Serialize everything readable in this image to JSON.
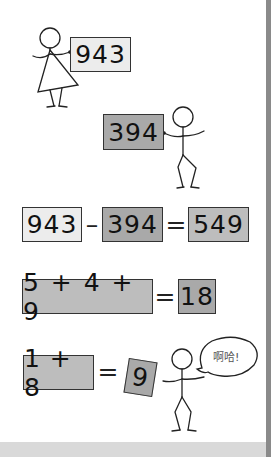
{
  "scene1": {
    "her_number": "943",
    "his_number": "394"
  },
  "equation1": {
    "left": "943",
    "op": "–",
    "middle": "394",
    "eq": "=",
    "result": "549"
  },
  "equation2": {
    "expr": "5 + 4 + 9",
    "eq": "=",
    "result": "18"
  },
  "equation3": {
    "expr": "1 + 8",
    "eq": "=",
    "result": "9",
    "speech": "啊哈!"
  },
  "colors": {
    "light_box": "#ececec",
    "mid_box": "#bdbdbd",
    "dark_box": "#a9a9a9",
    "right_bar": "#8a8a8a",
    "bottom_strip": "#d9d9d9"
  }
}
